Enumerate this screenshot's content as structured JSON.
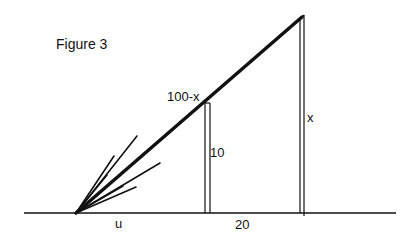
{
  "figure": {
    "title": "Figure 3",
    "labels": {
      "hypotenuse_segment": "100-x",
      "tall_pole": "x",
      "short_pole": "10",
      "gap_between_poles": "20",
      "ground_distance": "u"
    },
    "colors": {
      "background": "#ffffff",
      "stroke": "#111111"
    }
  }
}
